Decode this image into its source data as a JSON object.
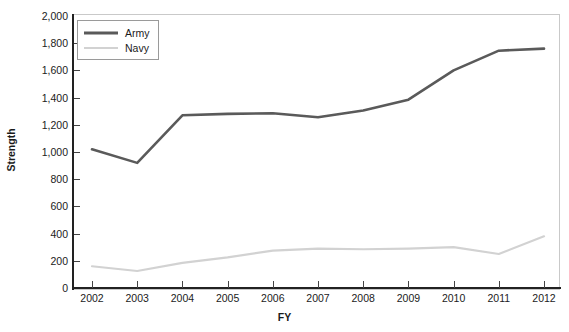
{
  "chart_data": {
    "type": "line",
    "title": "",
    "xlabel": "FY",
    "ylabel": "Strength",
    "x": [
      2002,
      2003,
      2004,
      2005,
      2006,
      2007,
      2008,
      2009,
      2010,
      2011,
      2012
    ],
    "categories": [
      "2002",
      "2003",
      "2004",
      "2005",
      "2006",
      "2007",
      "2008",
      "2009",
      "2010",
      "2011",
      "2012"
    ],
    "series": [
      {
        "name": "Army",
        "color": "#5a5a5a",
        "width": 2.6,
        "values": [
          1020,
          920,
          1270,
          1280,
          1285,
          1255,
          1305,
          1385,
          1600,
          1745,
          1760
        ]
      },
      {
        "name": "Navy",
        "color": "#d2d2d2",
        "width": 2.2,
        "values": [
          160,
          125,
          185,
          225,
          275,
          290,
          285,
          290,
          300,
          250,
          380
        ]
      }
    ],
    "ylim": [
      0,
      2000
    ],
    "ytick_values": [
      0,
      200,
      400,
      600,
      800,
      1000,
      1200,
      1400,
      1600,
      1800,
      2000
    ],
    "ytick_labels": [
      "0",
      "200",
      "400",
      "600",
      "800",
      "1,000",
      "1,200",
      "1,400",
      "1,600",
      "1,800",
      "2,000"
    ],
    "xlim": [
      2002,
      2012
    ],
    "grid": false,
    "legend_position": "top-left",
    "legend": [
      "Army",
      "Navy"
    ],
    "annotations": []
  },
  "colors": {
    "army": "#5a5a5a",
    "navy": "#d2d2d2",
    "axis": "#222222",
    "frame": "#c9c9c9",
    "text": "#1b1b1b",
    "background": "#ffffff"
  }
}
